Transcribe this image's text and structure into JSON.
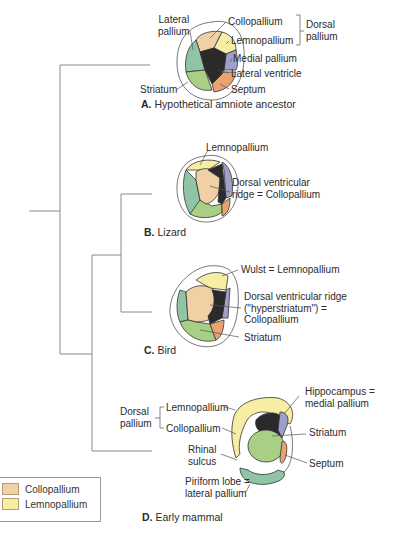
{
  "colors": {
    "collopallium": "#f0d0a4",
    "lemnopallium": "#f6eea4",
    "lateral_pallium": "#8fc5a4",
    "striatum": "#a9cf86",
    "medial_pallium": "#9f9fca",
    "septum": "#eaa274",
    "ventricle": "#2a2a2a",
    "line": "#7a7a7a"
  },
  "panels": {
    "A": {
      "letter": "A.",
      "caption": "Hypothetical amniote ancestor",
      "labels": {
        "lateral_pallium": [
          "Lateral",
          "pallium"
        ],
        "collopallium": "Collopallium",
        "lemnopallium": "Lemnopallium",
        "dorsal_pallium": [
          "Dorsal",
          "pallium"
        ],
        "medial_pallium": "Medial pallium",
        "lateral_ventricle": "Lateral ventricle",
        "striatum": "Striatum",
        "septum": "Septum"
      }
    },
    "B": {
      "letter": "B.",
      "caption": "Lizard",
      "labels": {
        "lemnopallium": "Lemnopallium",
        "dvr": [
          "Dorsal ventricular",
          "ridge = Collopallium"
        ]
      }
    },
    "C": {
      "letter": "C.",
      "caption": "Bird",
      "labels": {
        "wulst": "Wulst = Lemnopallium",
        "dvr": [
          "Dorsal ventricular ridge",
          "(\"hyperstriatum\") =",
          "Collopallium"
        ],
        "striatum": "Striatum"
      }
    },
    "D": {
      "letter": "D.",
      "caption": "Early mammal",
      "labels": {
        "dorsal_pallium": [
          "Dorsal",
          "pallium"
        ],
        "lemnopallium": "Lemnopallium",
        "collopallium": "Collopallium",
        "rhinal_sulcus": [
          "Rhinal",
          "sulcus"
        ],
        "piriform": [
          "Piriform lobe =",
          "lateral pallium"
        ],
        "hippocampus": [
          "Hippocampus =",
          "medial pallium"
        ],
        "striatum": "Striatum",
        "septum": "Septum"
      }
    }
  },
  "legend": {
    "items": [
      {
        "label": "Collopallium",
        "color": "#f0d0a4"
      },
      {
        "label": "Lemnopallium",
        "color": "#f6eea4"
      }
    ]
  }
}
